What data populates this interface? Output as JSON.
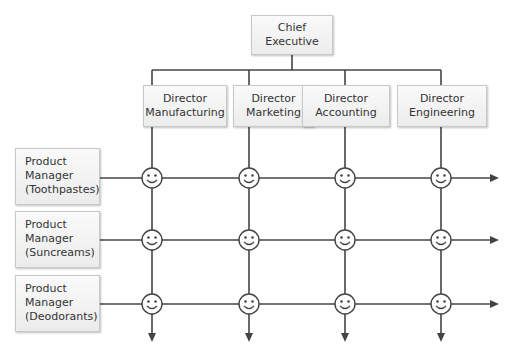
{
  "chief": {
    "line1": "Chief",
    "line2": "Executive"
  },
  "directors": [
    {
      "line1": "Director",
      "line2": "Manufacturing"
    },
    {
      "line1": "Director",
      "line2": "Marketing"
    },
    {
      "line1": "Director",
      "line2": "Accounting"
    },
    {
      "line1": "Director",
      "line2": "Engineering"
    }
  ],
  "product_managers": [
    {
      "line1": "Product",
      "line2": "Manager",
      "line3": "(Toothpastes)"
    },
    {
      "line1": "Product",
      "line2": "Manager",
      "line3": "(Suncreams)"
    },
    {
      "line1": "Product",
      "line2": "Manager",
      "line3": "(Deodorants)"
    }
  ],
  "node_icon": "smiley-face-icon",
  "colors": {
    "line": "#444444",
    "box_border": "#c8c8c8"
  }
}
